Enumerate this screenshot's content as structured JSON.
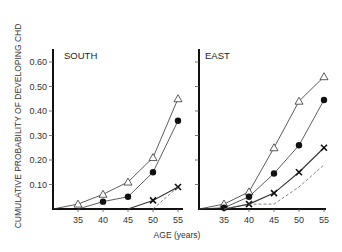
{
  "chart_data": [
    {
      "type": "line",
      "title": "SOUTH",
      "xlabel": "AGE (years)",
      "ylabel": "CUMULATIVE PROBABILITY OF DEVELOPING CHD",
      "x_ticks": [
        35,
        40,
        45,
        50,
        55
      ],
      "y_ticks": [
        "0.10",
        "0.20",
        "0.30",
        "0.40",
        "0.50",
        "0.60"
      ],
      "xlim": [
        30,
        55
      ],
      "ylim": [
        0,
        0.65
      ],
      "grid": false,
      "legend": "none",
      "series": [
        {
          "name": "triangle",
          "marker": "open-triangle",
          "line": "solid",
          "x": [
            30,
            35,
            40,
            45,
            50,
            55
          ],
          "values": [
            0,
            0.02,
            0.06,
            0.11,
            0.21,
            0.45
          ]
        },
        {
          "name": "circle",
          "marker": "filled-circle",
          "line": "solid",
          "x": [
            35,
            40,
            45,
            50,
            55
          ],
          "values": [
            0,
            0.03,
            0.05,
            0.15,
            0.36
          ]
        },
        {
          "name": "cross",
          "marker": "x",
          "line": "solid",
          "x": [
            45,
            50,
            55
          ],
          "values": [
            0,
            0.035,
            0.09
          ]
        },
        {
          "name": "dashed",
          "marker": "none",
          "line": "dashed",
          "x": [
            50,
            55
          ],
          "values": [
            0,
            0.09
          ]
        }
      ]
    },
    {
      "type": "line",
      "title": "EAST",
      "xlabel": "AGE (years)",
      "ylabel": "CUMULATIVE PROBABILITY OF DEVELOPING CHD",
      "x_ticks": [
        35,
        40,
        45,
        50,
        55
      ],
      "y_ticks": [
        "0.10",
        "0.20",
        "0.30",
        "0.40",
        "0.50",
        "0.60"
      ],
      "xlim": [
        30,
        55
      ],
      "ylim": [
        0,
        0.65
      ],
      "grid": false,
      "legend": "none",
      "series": [
        {
          "name": "triangle",
          "marker": "open-triangle",
          "line": "solid",
          "x": [
            30,
            35,
            40,
            45,
            50,
            55
          ],
          "values": [
            0,
            0.02,
            0.07,
            0.25,
            0.44,
            0.54
          ]
        },
        {
          "name": "circle",
          "marker": "filled-circle",
          "line": "solid",
          "x": [
            30,
            35,
            40,
            45,
            50,
            55
          ],
          "values": [
            0,
            0.005,
            0.05,
            0.145,
            0.26,
            0.445
          ]
        },
        {
          "name": "cross",
          "marker": "x",
          "line": "solid",
          "x": [
            35,
            40,
            45,
            50,
            55
          ],
          "values": [
            0,
            0.02,
            0.065,
            0.15,
            0.25
          ]
        },
        {
          "name": "dashed",
          "marker": "none",
          "line": "dashed",
          "x": [
            35,
            40,
            45,
            50,
            55
          ],
          "values": [
            0,
            0.02,
            0.02,
            0.09,
            0.18
          ]
        }
      ]
    }
  ],
  "labels": {
    "ylabel": "CUMULATIVE PROBABILITY OF DEVELOPING CHD",
    "xlabel": "AGE (years)",
    "south_title": "SOUTH",
    "east_title": "EAST",
    "y_ticks": [
      "0.10",
      "0.20",
      "0.30",
      "0.40",
      "0.50",
      "0.60"
    ],
    "x_ticks": [
      "35",
      "40",
      "45",
      "50",
      "55"
    ]
  }
}
